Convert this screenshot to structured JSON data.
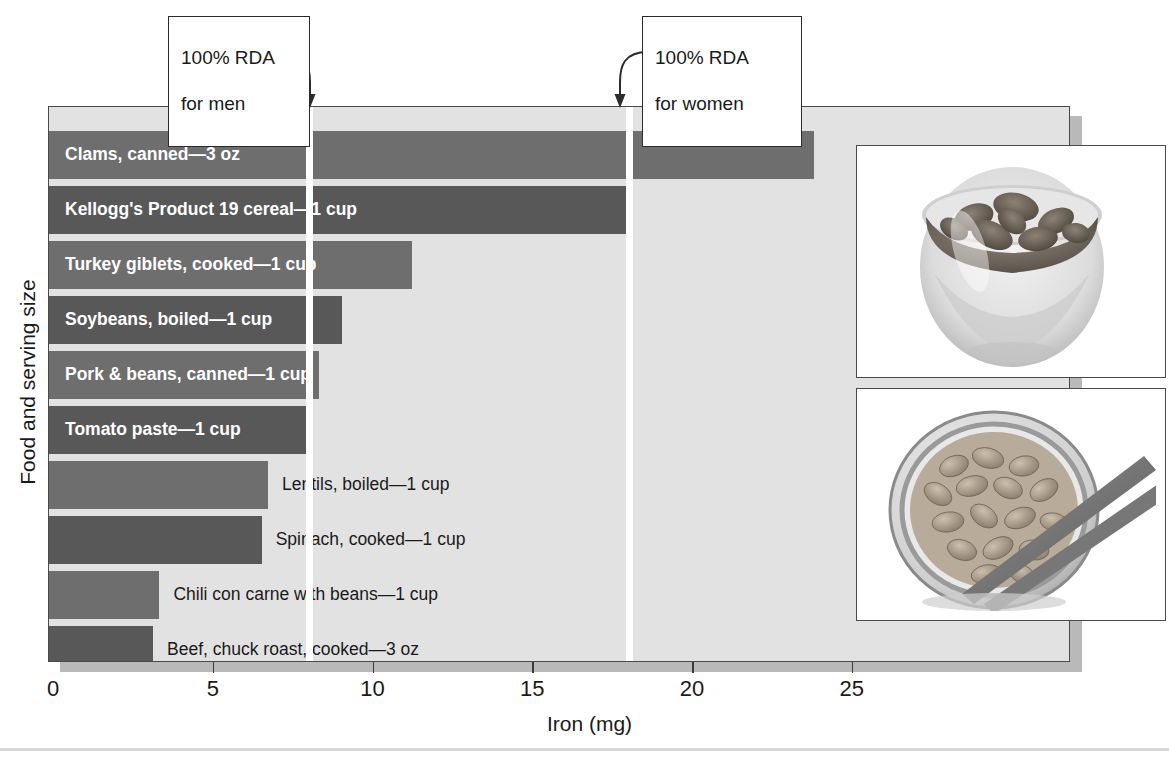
{
  "chart_data": {
    "type": "bar",
    "orientation": "horizontal",
    "title": "",
    "xlabel": "Iron (mg)",
    "ylabel": "Food and serving size",
    "xlim": [
      0,
      29.5
    ],
    "xticks": [
      0,
      5,
      10,
      15,
      20,
      25
    ],
    "xtick_labels": [
      "0",
      "5",
      "10",
      "15",
      "20",
      "25"
    ],
    "grid": false,
    "legend": "none",
    "categories": [
      "Clams, canned—3 oz",
      "Kellogg's Product 19 cereal—1 cup",
      "Turkey giblets, cooked—1 cup",
      "Soybeans, boiled—1 cup",
      "Pork & beans, canned—1 cup",
      "Tomato paste—1 cup",
      "Lentils, boiled—1 cup",
      "Spinach, cooked—1 cup",
      "Chili con carne with beans—1 cup",
      "Beef, chuck roast, cooked—3 oz"
    ],
    "values": [
      23.8,
      18.0,
      11.2,
      9.0,
      8.3,
      7.9,
      6.7,
      6.5,
      3.3,
      3.1
    ],
    "annotations": [
      {
        "label": "100% RDA\nfor men",
        "value": 8.0
      },
      {
        "label": "100% RDA\nfor women",
        "value": 18.0
      }
    ]
  },
  "axes": {
    "x_title": "Iron (mg)",
    "y_title": "Food and serving size",
    "x_ticks": [
      {
        "label": "0",
        "value": 0
      },
      {
        "label": "5",
        "value": 5
      },
      {
        "label": "10",
        "value": 10
      },
      {
        "label": "15",
        "value": 15
      },
      {
        "label": "20",
        "value": 20
      },
      {
        "label": "25",
        "value": 25
      }
    ]
  },
  "callouts": {
    "men": {
      "line1": "100% RDA",
      "line2": "for men"
    },
    "women": {
      "line1": "100% RDA",
      "line2": "for women"
    }
  },
  "bars": [
    {
      "label": "Clams, canned—3 oz",
      "value": 23.8,
      "label_position": "inside",
      "tone": "dark"
    },
    {
      "label": "Kellogg's Product 19 cereal—1 cup",
      "value": 18.0,
      "label_position": "inside",
      "tone": "darker"
    },
    {
      "label": "Turkey giblets, cooked—1 cup",
      "value": 11.2,
      "label_position": "inside",
      "tone": "dark"
    },
    {
      "label": "Soybeans, boiled—1 cup",
      "value": 9.0,
      "label_position": "inside",
      "tone": "darker"
    },
    {
      "label": "Pork & beans, canned—1 cup",
      "value": 8.3,
      "label_position": "inside",
      "tone": "dark"
    },
    {
      "label": "Tomato paste—1 cup",
      "value": 7.9,
      "label_position": "inside",
      "tone": "darker"
    },
    {
      "label": "Lentils, boiled—1 cup",
      "value": 6.7,
      "label_position": "outside",
      "tone": "dark"
    },
    {
      "label": "Spinach, cooked—1 cup",
      "value": 6.5,
      "label_position": "outside",
      "tone": "darker"
    },
    {
      "label": "Chili con carne with beans—1 cup",
      "value": 3.3,
      "label_position": "outside",
      "tone": "dark"
    },
    {
      "label": "Beef, chuck roast, cooked—3 oz",
      "value": 3.1,
      "label_position": "outside",
      "tone": "darker"
    }
  ],
  "rda_lines": [
    {
      "name": "men",
      "value": 8.0
    },
    {
      "name": "women",
      "value": 18.0
    }
  ],
  "photos": [
    {
      "name": "cereal-bowl-photo",
      "alt": "bowl-of-cereal-flakes"
    },
    {
      "name": "beans-bowl-photo",
      "alt": "bowl-of-beans-with-chopsticks"
    }
  ],
  "colors": {
    "bar_light": "#6e6e6e",
    "bar_dark": "#585858",
    "plot_background": "#e2e2e2",
    "plot_border": "#4a4a4a",
    "rda_line": "#ffffff",
    "text": "#1a1a1a",
    "inside_label": "#ffffff"
  }
}
